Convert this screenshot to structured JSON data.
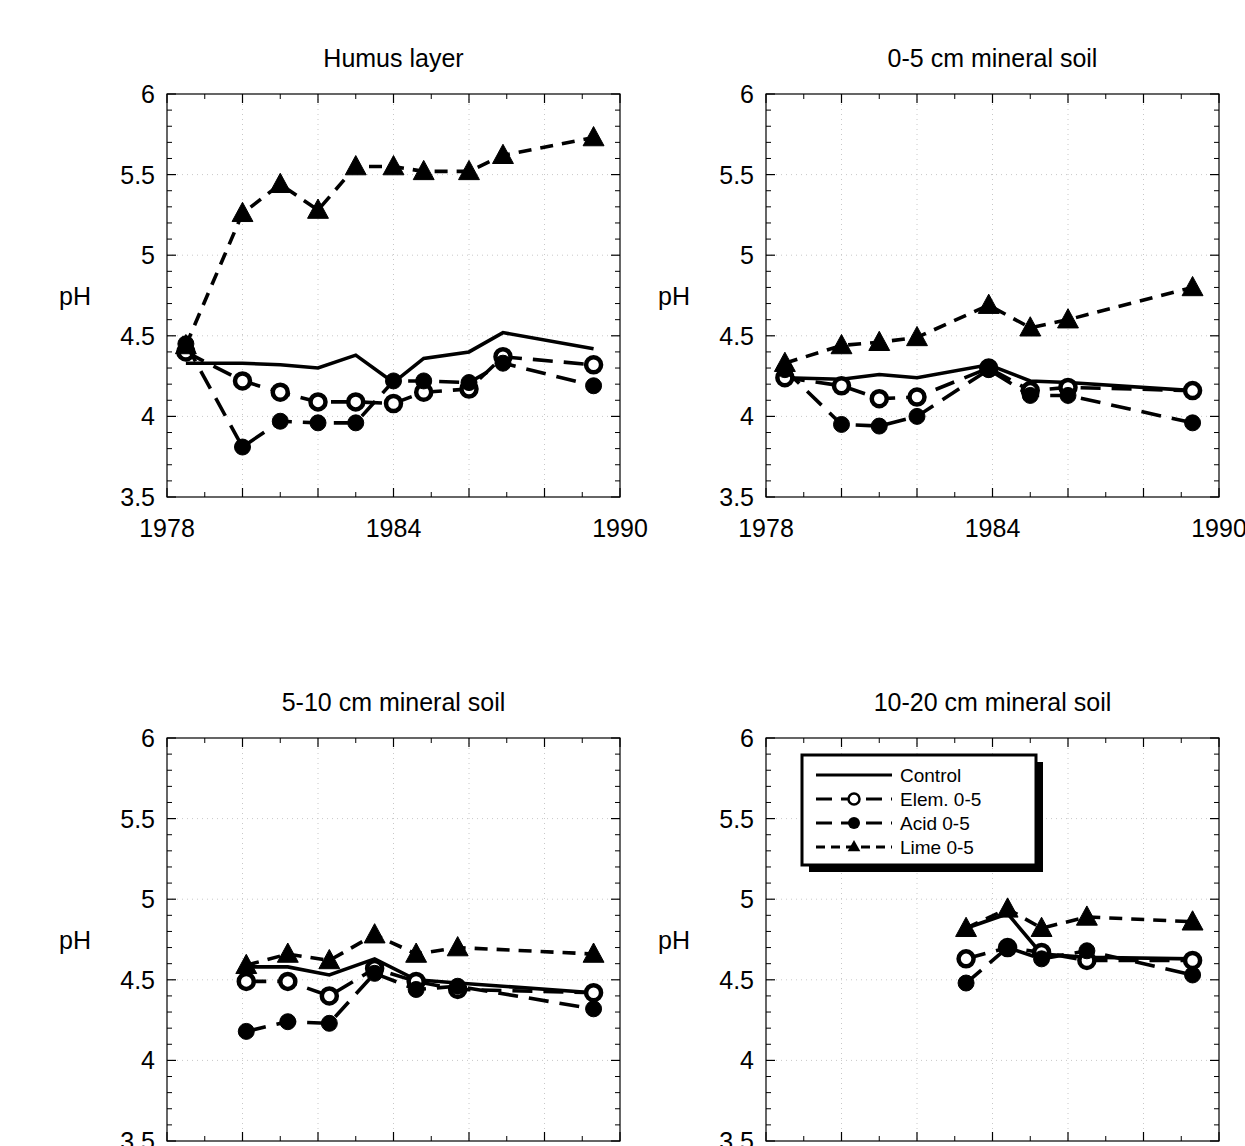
{
  "figure": {
    "background": "#ffffff",
    "ink_color": "#000000",
    "grid_color": "#c8c8c8"
  },
  "legend": {
    "position": "top-left of panel 4",
    "entries": [
      {
        "label": "Control",
        "style": "solid",
        "marker": "none"
      },
      {
        "label": "Elem. 0-5",
        "style": "dashed",
        "marker": "open-circle"
      },
      {
        "label": "Acid 0-5",
        "style": "dashed",
        "marker": "filled-circle"
      },
      {
        "label": "Lime 0-5",
        "style": "dashed",
        "marker": "filled-triangle"
      }
    ]
  },
  "chart_data": [
    {
      "type": "line",
      "panel": 1,
      "title": "Humus layer",
      "xlabel": "",
      "ylabel": "pH",
      "xlim": [
        1978,
        1990
      ],
      "ylim": [
        3.5,
        6
      ],
      "xticks": [
        1978,
        1980,
        1982,
        1984,
        1986,
        1988,
        1990
      ],
      "xticklabels": [
        "1978",
        "",
        "",
        "1984",
        "",
        "",
        "1990"
      ],
      "yticks": [
        3.5,
        4,
        4.5,
        5,
        5.5,
        6
      ],
      "yticklabels": [
        "3.5",
        "4",
        "4.5",
        "5",
        "5.5",
        "6"
      ],
      "grid": true,
      "axis_labels_visible": true,
      "series": [
        {
          "name": "Control",
          "x": [
            1978.5,
            1980,
            1981,
            1982,
            1983,
            1984,
            1984.8,
            1986,
            1986.9,
            1989.3
          ],
          "values": [
            4.33,
            4.33,
            4.32,
            4.3,
            4.38,
            4.21,
            4.36,
            4.4,
            4.52,
            4.42
          ]
        },
        {
          "name": "Elem. 0-5",
          "x": [
            1978.5,
            1980,
            1981,
            1982,
            1983,
            1984,
            1984.8,
            1986,
            1986.9,
            1989.3
          ],
          "values": [
            4.4,
            4.22,
            4.15,
            4.09,
            4.09,
            4.08,
            4.15,
            4.17,
            4.37,
            4.32
          ]
        },
        {
          "name": "Acid 0-5",
          "x": [
            1978.5,
            1980,
            1981,
            1982,
            1983,
            1984,
            1984.8,
            1986,
            1986.9,
            1989.3
          ],
          "values": [
            4.45,
            3.81,
            3.97,
            3.96,
            3.96,
            4.22,
            4.22,
            4.21,
            4.33,
            4.19
          ]
        },
        {
          "name": "Lime 0-5",
          "x": [
            1978.5,
            1980,
            1981,
            1982,
            1983,
            1984,
            1984.8,
            1986,
            1986.9,
            1989.3
          ],
          "values": [
            4.44,
            5.26,
            5.44,
            5.28,
            5.55,
            5.55,
            5.52,
            5.52,
            5.62,
            5.73
          ]
        }
      ]
    },
    {
      "type": "line",
      "panel": 2,
      "title": "0-5 cm mineral soil",
      "xlabel": "",
      "ylabel": "pH",
      "xlim": [
        1978,
        1990
      ],
      "ylim": [
        3.5,
        6
      ],
      "xticks": [
        1978,
        1980,
        1982,
        1984,
        1986,
        1988,
        1990
      ],
      "xticklabels": [
        "1978",
        "",
        "",
        "1984",
        "",
        "",
        "1990"
      ],
      "yticks": [
        3.5,
        4,
        4.5,
        5,
        5.5,
        6
      ],
      "yticklabels": [
        "3.5",
        "4",
        "4.5",
        "5",
        "5.5",
        "6"
      ],
      "grid": true,
      "axis_labels_visible": true,
      "series": [
        {
          "name": "Control",
          "x": [
            1978.5,
            1980,
            1981,
            1982,
            1983.9,
            1985,
            1986,
            1989.3
          ],
          "values": [
            4.24,
            4.23,
            4.26,
            4.24,
            4.32,
            4.22,
            4.21,
            4.16
          ]
        },
        {
          "name": "Elem. 0-5",
          "x": [
            1978.5,
            1980,
            1981,
            1982,
            1983.9,
            1985,
            1986,
            1989.3
          ],
          "values": [
            4.24,
            4.19,
            4.11,
            4.12,
            4.3,
            4.16,
            4.18,
            4.16
          ]
        },
        {
          "name": "Acid 0-5",
          "x": [
            1978.5,
            1980,
            1981,
            1982,
            1983.9,
            1985,
            1986,
            1989.3
          ],
          "values": [
            4.29,
            3.95,
            3.94,
            4.0,
            4.29,
            4.13,
            4.13,
            3.96
          ]
        },
        {
          "name": "Lime 0-5",
          "x": [
            1978.5,
            1980,
            1981,
            1982,
            1983.9,
            1985,
            1986,
            1989.3
          ],
          "values": [
            4.33,
            4.44,
            4.46,
            4.49,
            4.69,
            4.55,
            4.6,
            4.8
          ]
        }
      ]
    },
    {
      "type": "line",
      "panel": 3,
      "title": "5-10 cm mineral soil",
      "xlabel": "",
      "ylabel": "pH",
      "xlim": [
        1978,
        1990
      ],
      "ylim": [
        3.5,
        6
      ],
      "xticks": [
        1978,
        1980,
        1982,
        1984,
        1986,
        1988,
        1990
      ],
      "xticklabels": [
        "",
        "",
        "",
        "",
        "",
        "",
        ""
      ],
      "yticks": [
        3.5,
        4,
        4.5,
        5,
        5.5,
        6
      ],
      "yticklabels": [
        "3.5",
        "4",
        "4.5",
        "5",
        "5.5",
        "6"
      ],
      "grid": true,
      "axis_labels_visible": false,
      "series": [
        {
          "name": "Control",
          "x": [
            1980.1,
            1981.2,
            1982.3,
            1983.5,
            1984.6,
            1985.7,
            1989.3
          ],
          "values": [
            4.58,
            4.58,
            4.53,
            4.63,
            4.5,
            4.48,
            4.42
          ]
        },
        {
          "name": "Elem. 0-5",
          "x": [
            1980.1,
            1981.2,
            1982.3,
            1983.5,
            1984.6,
            1985.7,
            1989.3
          ],
          "values": [
            4.49,
            4.49,
            4.4,
            4.57,
            4.49,
            4.44,
            4.42
          ]
        },
        {
          "name": "Acid 0-5",
          "x": [
            1980.1,
            1981.2,
            1982.3,
            1983.5,
            1984.6,
            1985.7,
            1989.3
          ],
          "values": [
            4.18,
            4.24,
            4.23,
            4.54,
            4.44,
            4.46,
            4.32
          ]
        },
        {
          "name": "Lime 0-5",
          "x": [
            1980.1,
            1981.2,
            1982.3,
            1983.5,
            1984.6,
            1985.7,
            1989.3
          ],
          "values": [
            4.59,
            4.66,
            4.62,
            4.78,
            4.66,
            4.7,
            4.66
          ]
        }
      ]
    },
    {
      "type": "line",
      "panel": 4,
      "title": "10-20 cm mineral soil",
      "xlabel": "",
      "ylabel": "pH",
      "xlim": [
        1978,
        1990
      ],
      "ylim": [
        3.5,
        6
      ],
      "xticks": [
        1978,
        1980,
        1982,
        1984,
        1986,
        1988,
        1990
      ],
      "xticklabels": [
        "",
        "",
        "",
        "",
        "",
        "",
        ""
      ],
      "yticks": [
        3.5,
        4,
        4.5,
        5,
        5.5,
        6
      ],
      "yticklabels": [
        "3.5",
        "4",
        "4.5",
        "5",
        "5.5",
        "6"
      ],
      "grid": true,
      "axis_labels_visible": false,
      "series": [
        {
          "name": "Control",
          "x": [
            1983.3,
            1984.4,
            1985.3,
            1986.5,
            1989.3
          ],
          "values": [
            4.82,
            4.91,
            4.66,
            4.64,
            4.63
          ]
        },
        {
          "name": "Elem. 0-5",
          "x": [
            1983.3,
            1984.4,
            1985.3,
            1986.5,
            1989.3
          ],
          "values": [
            4.63,
            4.7,
            4.67,
            4.62,
            4.62
          ]
        },
        {
          "name": "Acid 0-5",
          "x": [
            1983.3,
            1984.4,
            1985.3,
            1986.5,
            1989.3
          ],
          "values": [
            4.48,
            4.7,
            4.63,
            4.68,
            4.53
          ]
        },
        {
          "name": "Lime 0-5",
          "x": [
            1983.3,
            1984.4,
            1985.3,
            1986.5,
            1989.3
          ],
          "values": [
            4.82,
            4.94,
            4.82,
            4.89,
            4.86
          ]
        }
      ]
    }
  ]
}
